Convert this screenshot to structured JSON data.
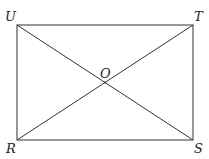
{
  "diagram": {
    "type": "rectangle-with-diagonals",
    "stroke_color": "#333333",
    "background": "#ffffff",
    "vertices": {
      "U": {
        "label": "U",
        "x": 17,
        "y": 25
      },
      "T": {
        "label": "T",
        "x": 193,
        "y": 25
      },
      "R": {
        "label": "R",
        "x": 17,
        "y": 140
      },
      "S": {
        "label": "S",
        "x": 193,
        "y": 140
      },
      "O": {
        "label": "O",
        "x": 105,
        "y": 82.5
      }
    },
    "segments": [
      "UT",
      "TS",
      "SR",
      "RU",
      "US",
      "RT"
    ]
  }
}
